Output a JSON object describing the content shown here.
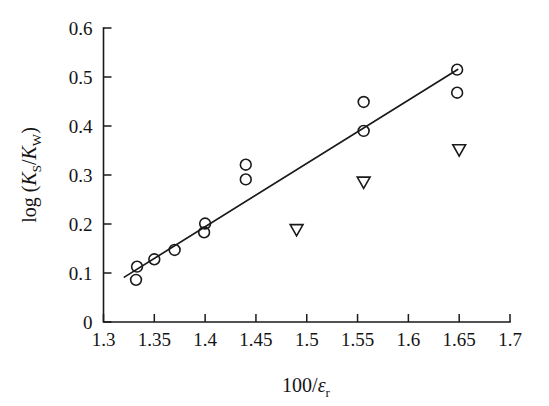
{
  "chart_data": {
    "type": "scatter",
    "title": "",
    "xlabel": "100/εr",
    "xlabel_main": "100/",
    "xlabel_symbol": "ε",
    "xlabel_sub": "r",
    "ylabel": "log (KS/KW)",
    "ylabel_prefix": "log (",
    "ylabel_k1": "K",
    "ylabel_k1_sub": "S",
    "ylabel_slash": "/",
    "ylabel_k2": "K",
    "ylabel_k2_sub": "W",
    "ylabel_suffix": ")",
    "xlim": [
      1.3,
      1.7
    ],
    "ylim": [
      0.0,
      0.6
    ],
    "grid": false,
    "legend": "none",
    "xticks": [
      1.3,
      1.35,
      1.4,
      1.45,
      1.5,
      1.55,
      1.6,
      1.65,
      1.7
    ],
    "xtick_labels": [
      "1.3",
      "1.35",
      "1.4",
      "1.45",
      "1.5",
      "1.55",
      "1.6",
      "1.65",
      "1.7"
    ],
    "yticks": [
      0.0,
      0.1,
      0.2,
      0.3,
      0.4,
      0.5,
      0.6
    ],
    "ytick_labels": [
      "0",
      "0.1",
      "0.2",
      "0.3",
      "0.4",
      "0.5",
      "0.6"
    ],
    "series": [
      {
        "name": "open-circle",
        "marker": "circle",
        "points": [
          {
            "x": 1.333,
            "y": 0.113
          },
          {
            "x": 1.332,
            "y": 0.086
          },
          {
            "x": 1.35,
            "y": 0.128
          },
          {
            "x": 1.37,
            "y": 0.147
          },
          {
            "x": 1.4,
            "y": 0.201
          },
          {
            "x": 1.399,
            "y": 0.183
          },
          {
            "x": 1.44,
            "y": 0.321
          },
          {
            "x": 1.44,
            "y": 0.291
          },
          {
            "x": 1.556,
            "y": 0.449
          },
          {
            "x": 1.556,
            "y": 0.39
          },
          {
            "x": 1.648,
            "y": 0.515
          },
          {
            "x": 1.648,
            "y": 0.468
          }
        ]
      },
      {
        "name": "open-down-triangle",
        "marker": "triangle-down",
        "points": [
          {
            "x": 1.49,
            "y": 0.188
          },
          {
            "x": 1.556,
            "y": 0.285
          },
          {
            "x": 1.65,
            "y": 0.351
          }
        ]
      }
    ],
    "fit_line": {
      "name": "regression-line",
      "x1": 1.3205,
      "y1": 0.0916,
      "x2": 1.6485,
      "y2": 0.5155
    },
    "colors": {
      "axis": "#1a1a1a",
      "marker": "#1a1a1a",
      "line": "#1a1a1a",
      "background": "#ffffff"
    }
  }
}
